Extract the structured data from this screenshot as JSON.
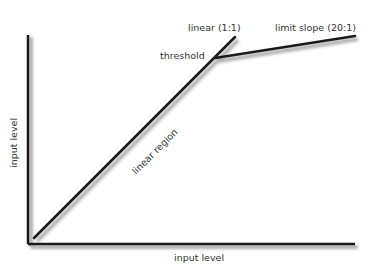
{
  "diagram": {
    "type": "compressor-transfer-curve",
    "colors": {
      "line": "#1a1a1a",
      "shadow": "#9a9a9a",
      "text": "#333333",
      "background": "#ffffff"
    },
    "axes": {
      "x_label": "input level",
      "y_label": "input level"
    },
    "labels": {
      "linear": "linear (1:1)",
      "limit_slope": "limit slope (20:1)",
      "threshold": "threshold",
      "linear_region": "linear region"
    },
    "geometry": {
      "origin": [
        28,
        244
      ],
      "y_axis_top": [
        28,
        35
      ],
      "x_axis_right": [
        355,
        244
      ],
      "linear_start": [
        34,
        238
      ],
      "threshold_point": [
        215,
        58
      ],
      "linear_end": [
        235,
        37
      ],
      "limit_end": [
        355,
        36
      ]
    }
  }
}
